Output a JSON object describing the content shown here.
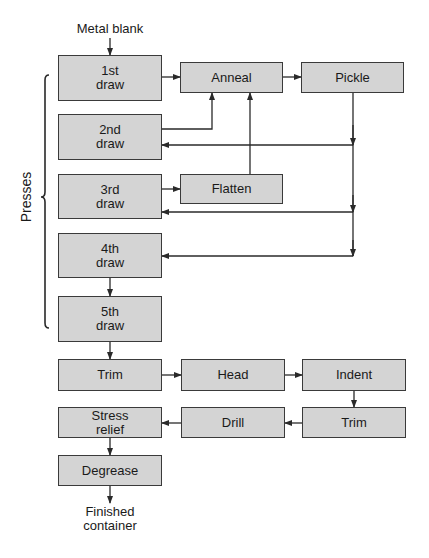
{
  "input_label": "Metal blank",
  "output_label_line1": "Finished",
  "output_label_line2": "container",
  "group_label": "Presses",
  "colors": {
    "box_fill": "#d4d4d4",
    "box_border": "#3a3a3a",
    "line": "#2a2a2a"
  },
  "nodes": {
    "draw1": {
      "line1": "1st",
      "line2": "draw"
    },
    "draw2": {
      "line1": "2nd",
      "line2": "draw"
    },
    "draw3": {
      "line1": "3rd",
      "line2": "draw"
    },
    "draw4": {
      "line1": "4th",
      "line2": "draw"
    },
    "draw5": {
      "line1": "5th",
      "line2": "draw"
    },
    "anneal": {
      "label": "Anneal"
    },
    "pickle": {
      "label": "Pickle"
    },
    "flatten": {
      "label": "Flatten"
    },
    "trim1": {
      "label": "Trim"
    },
    "head": {
      "label": "Head"
    },
    "indent": {
      "label": "Indent"
    },
    "trim2": {
      "label": "Trim"
    },
    "drill": {
      "label": "Drill"
    },
    "stress": {
      "line1": "Stress",
      "line2": "relief"
    },
    "degrease": {
      "label": "Degrease"
    }
  },
  "edges": [
    [
      "Metal blank",
      "1st draw"
    ],
    [
      "1st draw",
      "Anneal"
    ],
    [
      "2nd draw",
      "Anneal"
    ],
    [
      "Flatten",
      "Anneal"
    ],
    [
      "Anneal",
      "Pickle"
    ],
    [
      "Pickle",
      "2nd draw"
    ],
    [
      "Pickle",
      "3rd draw"
    ],
    [
      "Pickle",
      "4th draw"
    ],
    [
      "3rd draw",
      "Flatten"
    ],
    [
      "4th draw",
      "5th draw"
    ],
    [
      "5th draw",
      "Trim"
    ],
    [
      "Trim",
      "Head"
    ],
    [
      "Head",
      "Indent"
    ],
    [
      "Indent",
      "Trim"
    ],
    [
      "Trim",
      "Drill"
    ],
    [
      "Drill",
      "Stress relief"
    ],
    [
      "Stress relief",
      "Degrease"
    ],
    [
      "Degrease",
      "Finished container"
    ]
  ]
}
